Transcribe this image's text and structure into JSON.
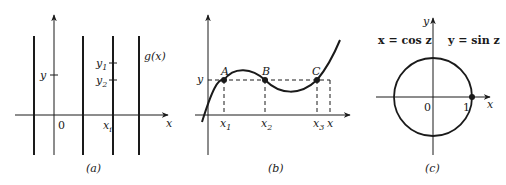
{
  "panels": [
    {
      "id": "a",
      "caption": "(a)",
      "labels": {
        "y": "y",
        "y1": "y",
        "y1_sub": "1",
        "y2": "y",
        "y2_sub": "2",
        "g": "g(x)",
        "origin": "0",
        "xi": "x",
        "xi_sub": "i",
        "x_axis": "x"
      }
    },
    {
      "id": "b",
      "caption": "(b)",
      "labels": {
        "y": "y",
        "A": "A",
        "B": "B",
        "C": "C",
        "x1": "x",
        "x1_sub": "1",
        "x2": "x",
        "x2_sub": "2",
        "x3": "x",
        "x3_sub": "3",
        "x_axis": "x"
      }
    },
    {
      "id": "c",
      "caption": "(c)",
      "labels": {
        "y_axis": "y",
        "eq_x": "x = cos z",
        "eq_y": "y = sin z",
        "origin": "0",
        "one": "1",
        "x_axis": "x"
      }
    }
  ],
  "colors": {
    "ink": "#1a1a1a",
    "background": "#ffffff"
  }
}
